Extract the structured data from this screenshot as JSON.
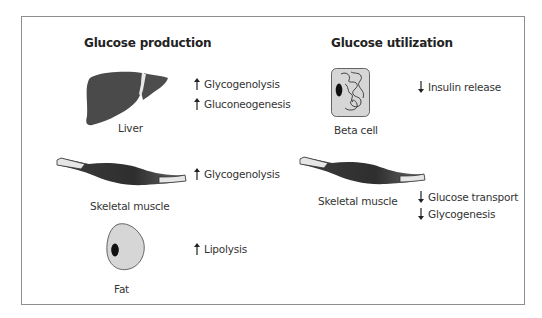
{
  "production": {
    "heading": "Glucose production",
    "organs": [
      {
        "name": "Liver",
        "effects": [
          {
            "direction": "up",
            "text": "Glycogenolysis"
          },
          {
            "direction": "up",
            "text": "Gluconeogenesis"
          }
        ]
      },
      {
        "name": "Skeletal muscle",
        "effects": [
          {
            "direction": "up",
            "text": "Glycogenolysis"
          }
        ]
      },
      {
        "name": "Fat",
        "effects": [
          {
            "direction": "up",
            "text": "Lipolysis"
          }
        ]
      }
    ]
  },
  "utilization": {
    "heading": "Glucose utilization",
    "organs": [
      {
        "name": "Beta cell",
        "effects": [
          {
            "direction": "down",
            "text": "Insulin release"
          }
        ]
      },
      {
        "name": "Skeletal muscle",
        "effects": [
          {
            "direction": "down",
            "text": "Glucose transport"
          },
          {
            "direction": "down",
            "text": "Glycogenesis"
          }
        ]
      }
    ]
  },
  "colors": {
    "organ_dark": "#4a4a4a",
    "cell_fill": "#d6d6d6",
    "border": "#8e8e8e",
    "text": "#333333"
  }
}
